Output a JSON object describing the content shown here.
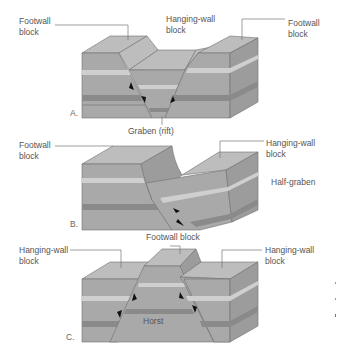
{
  "diagrams": [
    {
      "panel_label": "A.",
      "caption": "Graben (rift)",
      "labels": {
        "left": [
          "Footwall",
          "block"
        ],
        "center": [
          "Hanging-wall",
          "block"
        ],
        "right": [
          "Footwall",
          "block"
        ]
      }
    },
    {
      "panel_label": "B.",
      "caption": "Half-graben",
      "labels": {
        "left": [
          "Footwall",
          "block"
        ],
        "right": [
          "Hanging-wall",
          "block"
        ]
      }
    },
    {
      "panel_label": "C.",
      "caption": "Horst",
      "labels": {
        "top": [
          "Footwall block"
        ],
        "left": [
          "Hanging-wall",
          "block"
        ],
        "right": [
          "Hanging-wall",
          "block"
        ]
      }
    }
  ],
  "colors": {
    "top_face": "#bdbdbd",
    "front_face": "#a9a9a9",
    "side_face": "#9c9c9c",
    "light_layer": "#cfcfcf",
    "dark_layer": "#8a8a8a",
    "text": "#555555"
  }
}
